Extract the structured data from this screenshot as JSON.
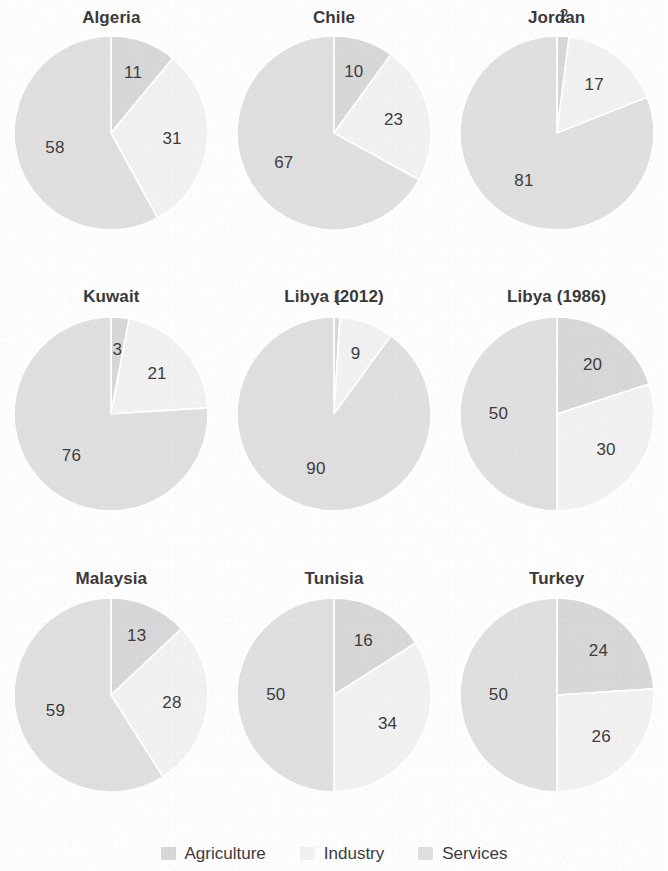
{
  "chart_data": {
    "type": "pie",
    "title": "",
    "categories": [
      "Agriculture",
      "Industry",
      "Services"
    ],
    "colors": {
      "Agriculture": "#d7d7d7",
      "Industry": "#f1f1f1",
      "Services": "#dfdfdf"
    },
    "units": "percent",
    "start_angle_deg": 0,
    "direction": "clockwise",
    "legend_position": "bottom",
    "grid": false,
    "panels": [
      {
        "title": "Algeria",
        "values": [
          11,
          31,
          58
        ],
        "labels": [
          "11",
          "31",
          "58"
        ],
        "label_outside": [
          false,
          false,
          false
        ]
      },
      {
        "title": "Chile",
        "values": [
          10,
          23,
          67
        ],
        "labels": [
          "10",
          "23",
          "67"
        ],
        "label_outside": [
          false,
          false,
          false
        ]
      },
      {
        "title": "Jordan",
        "values": [
          2,
          17,
          81
        ],
        "labels": [
          "2",
          "17",
          "81"
        ],
        "label_outside": [
          true,
          false,
          false
        ]
      },
      {
        "title": "Kuwait",
        "values": [
          3,
          21,
          76
        ],
        "labels": [
          "3",
          "21",
          "76"
        ],
        "label_outside": [
          false,
          false,
          false
        ]
      },
      {
        "title": "Libya (2012)",
        "values": [
          1,
          9,
          90
        ],
        "labels": [
          "1",
          "9",
          "90"
        ],
        "label_outside": [
          true,
          false,
          false
        ]
      },
      {
        "title": "Libya (1986)",
        "values": [
          20,
          30,
          50
        ],
        "labels": [
          "20",
          "30",
          "50"
        ],
        "label_outside": [
          false,
          false,
          false
        ]
      },
      {
        "title": "Malaysia",
        "values": [
          13,
          28,
          59
        ],
        "labels": [
          "13",
          "28",
          "59"
        ],
        "label_outside": [
          false,
          false,
          false
        ]
      },
      {
        "title": "Tunisia",
        "values": [
          16,
          34,
          50
        ],
        "labels": [
          "16",
          "34",
          "50"
        ],
        "label_outside": [
          false,
          false,
          false
        ]
      },
      {
        "title": "Turkey",
        "values": [
          24,
          26,
          50
        ],
        "labels": [
          "24",
          "26",
          "50"
        ],
        "label_outside": [
          false,
          false,
          false
        ]
      }
    ]
  },
  "legend": {
    "items": [
      {
        "label": "Agriculture",
        "color": "#d7d7d7"
      },
      {
        "label": "Industry",
        "color": "#f1f1f1"
      },
      {
        "label": "Services",
        "color": "#dfdfdf"
      }
    ]
  }
}
